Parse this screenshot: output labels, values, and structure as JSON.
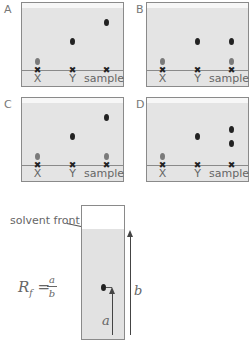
{
  "panels": [
    {
      "id": "A",
      "label": "A",
      "lanes": [
        "X",
        "Y",
        "sample"
      ],
      "spots": {
        "X": [
          {
            "y": 58,
            "tone": "grey"
          }
        ],
        "Y": [
          {
            "y": 39,
            "tone": "dark"
          }
        ],
        "sample": [
          {
            "y": 20,
            "tone": "dark"
          }
        ]
      }
    },
    {
      "id": "B",
      "label": "B",
      "lanes": [
        "X",
        "Y",
        "sample"
      ],
      "spots": {
        "X": [
          {
            "y": 58,
            "tone": "grey"
          }
        ],
        "Y": [
          {
            "y": 39,
            "tone": "dark"
          }
        ],
        "sample": [
          {
            "y": 39,
            "tone": "dark"
          },
          {
            "y": 58,
            "tone": "grey"
          }
        ]
      }
    },
    {
      "id": "C",
      "label": "C",
      "lanes": [
        "X",
        "Y",
        "sample"
      ],
      "spots": {
        "X": [
          {
            "y": 58,
            "tone": "grey"
          }
        ],
        "Y": [
          {
            "y": 39,
            "tone": "dark"
          }
        ],
        "sample": [
          {
            "y": 20,
            "tone": "dark"
          },
          {
            "y": 58,
            "tone": "grey"
          }
        ]
      }
    },
    {
      "id": "D",
      "label": "D",
      "lanes": [
        "X",
        "Y",
        "sample"
      ],
      "spots": {
        "X": [
          {
            "y": 58,
            "tone": "grey"
          }
        ],
        "Y": [
          {
            "y": 39,
            "tone": "dark"
          }
        ],
        "sample": [
          {
            "y": 32,
            "tone": "dark"
          },
          {
            "y": 46,
            "tone": "dark"
          }
        ]
      }
    }
  ],
  "lane_labels": {
    "x": "X",
    "y": "Y",
    "sample": "sample"
  },
  "cross_glyph": "✖",
  "rf_diagram": {
    "solvent_front_label": "solvent front",
    "formula_main": "R",
    "formula_sub": "f",
    "formula_eq": " =",
    "numerator": "a",
    "denominator": "b",
    "distance_a_label": "a",
    "distance_b_label": "b"
  },
  "colors": {
    "plate": "#e4e4e4",
    "spot_dark": "#222222",
    "spot_grey": "#7a7a7a",
    "border": "#8a8a8a"
  }
}
